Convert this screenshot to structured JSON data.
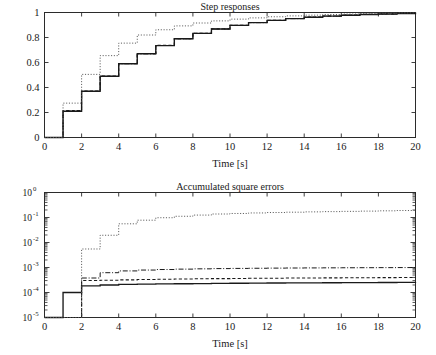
{
  "figure": {
    "width": 436,
    "height": 355,
    "background": "#ffffff",
    "ink_color": "#1a1a1a"
  },
  "chart_data": [
    {
      "type": "line",
      "id": "step-responses",
      "title": "Step responses",
      "xlabel": "Time [s]",
      "ylabel": "",
      "xlim": [
        0,
        20
      ],
      "ylim": [
        0,
        1
      ],
      "yscale": "linear",
      "grid": false,
      "legend": "none",
      "xticks": [
        0,
        2,
        4,
        6,
        8,
        10,
        12,
        14,
        16,
        18,
        20
      ],
      "xticklabels": [
        "0",
        "2",
        "4",
        "6",
        "8",
        "10",
        "12",
        "14",
        "16",
        "18",
        "20"
      ],
      "yticks": [
        0,
        0.2,
        0.4,
        0.6,
        0.8,
        1
      ],
      "yticklabels": [
        "0",
        "0.2",
        "0.4",
        "0.6",
        "0.8",
        "1"
      ],
      "drawstyle": "steps-post",
      "x": [
        0,
        1,
        2,
        3,
        4,
        5,
        6,
        7,
        8,
        9,
        10,
        11,
        12,
        13,
        14,
        15,
        16,
        17,
        18,
        19,
        20
      ],
      "series": [
        {
          "name": "solid",
          "style": "solid",
          "values": [
            0,
            0.21,
            0.37,
            0.49,
            0.59,
            0.67,
            0.735,
            0.79,
            0.833,
            0.868,
            0.897,
            0.919,
            0.937,
            0.951,
            0.962,
            0.971,
            0.978,
            0.984,
            0.988,
            0.992,
            1.0
          ]
        },
        {
          "name": "dashed",
          "style": "dashed",
          "values": [
            0,
            0.215,
            0.372,
            0.492,
            0.592,
            0.672,
            0.737,
            0.791,
            0.834,
            0.869,
            0.898,
            0.92,
            0.938,
            0.952,
            0.963,
            0.972,
            0.979,
            0.985,
            0.989,
            0.993,
            1.0
          ]
        },
        {
          "name": "dash-dot",
          "style": "dashdot",
          "values": [
            0,
            0.212,
            0.369,
            0.489,
            0.59,
            0.669,
            0.736,
            0.79,
            0.833,
            0.868,
            0.897,
            0.919,
            0.937,
            0.951,
            0.962,
            0.971,
            0.978,
            0.984,
            0.988,
            0.992,
            1.0
          ]
        },
        {
          "name": "dotted",
          "style": "dotted",
          "values": [
            0,
            0.275,
            0.505,
            0.655,
            0.755,
            0.82,
            0.862,
            0.893,
            0.916,
            0.933,
            0.947,
            0.957,
            0.966,
            0.973,
            0.979,
            0.984,
            0.988,
            0.991,
            0.994,
            0.997,
            1.0
          ]
        }
      ]
    },
    {
      "type": "line",
      "id": "accumulated-square-errors",
      "title": "Accumulated square errors",
      "xlabel": "Time [s]",
      "ylabel": "",
      "xlim": [
        0,
        20
      ],
      "ylim": [
        1e-05,
        1
      ],
      "yscale": "log",
      "grid": false,
      "legend": "none",
      "xticks": [
        0,
        2,
        4,
        6,
        8,
        10,
        12,
        14,
        16,
        18,
        20
      ],
      "xticklabels": [
        "0",
        "2",
        "4",
        "6",
        "8",
        "10",
        "12",
        "14",
        "16",
        "18",
        "20"
      ],
      "yticks": [
        1,
        0.1,
        0.01,
        0.001,
        0.0001,
        1e-05
      ],
      "yticklabels": [
        "10",
        "10",
        "10",
        "10",
        "10",
        "10"
      ],
      "ytickexponents": [
        "0",
        "-1",
        "-2",
        "-3",
        "-4",
        "-5"
      ],
      "drawstyle": "steps-post",
      "x": [
        0,
        1,
        2,
        3,
        4,
        5,
        6,
        7,
        8,
        9,
        10,
        11,
        12,
        13,
        14,
        15,
        16,
        17,
        18,
        19,
        20
      ],
      "series": [
        {
          "name": "solid",
          "style": "solid",
          "values": [
            1e-05,
            0.0001,
            0.000185,
            0.0002,
            0.00021,
            0.000216,
            0.00022,
            0.000224,
            0.000228,
            0.000231,
            0.000234,
            0.000237,
            0.00024,
            0.000242,
            0.000244,
            0.000246,
            0.000248,
            0.00025,
            0.000252,
            0.000254,
            0.000255
          ]
        },
        {
          "name": "dashed",
          "style": "dashed",
          "values": [
            1e-05,
            1e-05,
            0.0003,
            0.00031,
            0.00032,
            0.00033,
            0.00034,
            0.000348,
            0.000355,
            0.00036,
            0.000365,
            0.00037,
            0.000374,
            0.000378,
            0.000382,
            0.000385,
            0.000388,
            0.000391,
            0.000394,
            0.000397,
            0.0004
          ]
        },
        {
          "name": "dash-dot",
          "style": "dashdot",
          "values": [
            1e-05,
            1e-05,
            0.00038,
            0.00062,
            0.00073,
            0.00079,
            0.00083,
            0.00086,
            0.000885,
            0.000905,
            0.00092,
            0.000933,
            0.000945,
            0.000955,
            0.000963,
            0.00097,
            0.000977,
            0.000983,
            0.000988,
            0.000994,
            0.001
          ]
        },
        {
          "name": "dotted",
          "style": "dotted",
          "values": [
            1e-05,
            1e-05,
            0.0055,
            0.0195,
            0.056,
            0.078,
            0.098,
            0.112,
            0.125,
            0.138,
            0.145,
            0.152,
            0.158,
            0.163,
            0.168,
            0.172,
            0.176,
            0.18,
            0.185,
            0.19,
            0.195
          ]
        }
      ]
    }
  ]
}
